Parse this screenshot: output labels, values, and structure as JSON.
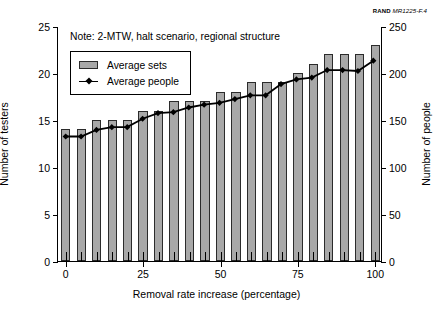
{
  "credit": {
    "org": "RAND",
    "figure_id": "MR1225-F.4"
  },
  "note": "Note:  2-MTW, halt scenario, regional structure",
  "legend": {
    "items": [
      {
        "label": "Average sets",
        "marker": "bar-swatch",
        "color": "#a8a8a8"
      },
      {
        "label": "Average people",
        "marker": "line-diamond",
        "color": "#000000"
      }
    ]
  },
  "chart_data": {
    "type": "bar",
    "title": "",
    "subtitle": "",
    "xlabel": "Removal rate increase (percentage)",
    "ylabel": "Number of testers",
    "y2label": "Number of people",
    "xlim": [
      -2.5,
      102.5
    ],
    "ylim": [
      0,
      25
    ],
    "y2lim": [
      0,
      250
    ],
    "grid": false,
    "legend_position": "upper-left-inside",
    "xticks": [
      0,
      25,
      50,
      75,
      100
    ],
    "xticklabels": [
      "0",
      "25",
      "50",
      "75",
      "100"
    ],
    "yticks": [
      0,
      5,
      10,
      15,
      20,
      25
    ],
    "yticklabels": [
      "0",
      "5",
      "10",
      "15",
      "20",
      "25"
    ],
    "y2ticks": [
      0,
      50,
      100,
      150,
      200,
      250
    ],
    "y2ticklabels": [
      "0",
      "50",
      "100",
      "150",
      "200",
      "250"
    ],
    "x": [
      0,
      5,
      10,
      15,
      20,
      25,
      30,
      35,
      40,
      45,
      50,
      55,
      60,
      65,
      70,
      75,
      80,
      85,
      90,
      95,
      100
    ],
    "series": [
      {
        "name": "Average sets",
        "axis": "left",
        "type": "bar",
        "color": "#a8a8a8",
        "values": [
          14,
          14,
          15,
          15,
          15,
          16,
          16,
          17,
          17,
          17,
          18,
          18,
          19,
          19,
          19,
          20,
          21,
          22,
          22,
          22,
          23
        ]
      },
      {
        "name": "Average people",
        "axis": "right",
        "type": "line",
        "color": "#000000",
        "values": [
          133,
          133,
          140,
          143,
          143,
          152,
          158,
          159,
          164,
          167,
          169,
          173,
          177,
          177,
          189,
          194,
          196,
          204,
          204,
          203,
          214
        ]
      }
    ]
  }
}
